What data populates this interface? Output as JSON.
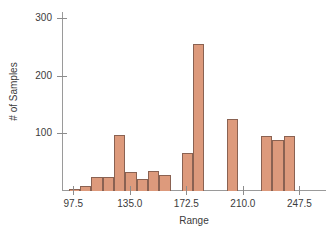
{
  "chart_data": {
    "type": "bar",
    "title": "",
    "subtitle": "",
    "xlabel": "Range",
    "ylabel": "# of Samples",
    "xlim": [
      90,
      262.5
    ],
    "ylim": [
      0,
      310
    ],
    "grid": false,
    "legend": null,
    "bin_width": 7.5,
    "xticks": [
      "97.5",
      "135.0",
      "172.5",
      "210.0",
      "247.5"
    ],
    "xtick_values": [
      97.5,
      135.0,
      172.5,
      210.0,
      247.5
    ],
    "yticks": [
      "100",
      "200",
      "300"
    ],
    "ytick_values": [
      100,
      200,
      300
    ],
    "bar_color": "#dd9a7c",
    "bar_edge_color": "#8a6252",
    "axis_color": "#9a9a9a",
    "categories": [
      94.5,
      102.0,
      109.5,
      117.0,
      124.5,
      132.0,
      139.5,
      147.0,
      154.5,
      162.0,
      169.5,
      177.0,
      184.5,
      192.0,
      199.5,
      207.0,
      214.5,
      222.0,
      229.5,
      237.0,
      244.5
    ],
    "values": [
      3,
      8,
      25,
      25,
      97,
      33,
      20,
      35,
      28,
      0,
      65,
      255,
      0,
      0,
      125,
      0,
      0,
      95,
      88,
      95,
      0
    ],
    "bars": [
      {
        "x0": 94.5,
        "x1": 102.0,
        "value": 3
      },
      {
        "x0": 102.0,
        "x1": 109.5,
        "value": 8
      },
      {
        "x0": 109.5,
        "x1": 117.0,
        "value": 25
      },
      {
        "x0": 117.0,
        "x1": 124.5,
        "value": 25
      },
      {
        "x0": 124.5,
        "x1": 132.0,
        "value": 97
      },
      {
        "x0": 132.0,
        "x1": 139.5,
        "value": 33
      },
      {
        "x0": 139.5,
        "x1": 147.0,
        "value": 20
      },
      {
        "x0": 147.0,
        "x1": 154.5,
        "value": 35
      },
      {
        "x0": 154.5,
        "x1": 162.0,
        "value": 28
      },
      {
        "x0": 169.5,
        "x1": 177.0,
        "value": 65
      },
      {
        "x0": 177.0,
        "x1": 184.5,
        "value": 255
      },
      {
        "x0": 199.5,
        "x1": 207.0,
        "value": 125
      },
      {
        "x0": 222.0,
        "x1": 229.5,
        "value": 95
      },
      {
        "x0": 229.5,
        "x1": 237.0,
        "value": 88
      },
      {
        "x0": 237.0,
        "x1": 244.5,
        "value": 95
      }
    ]
  }
}
